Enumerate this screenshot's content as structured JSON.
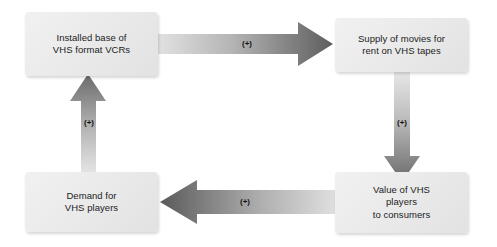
{
  "diagram": {
    "background_color": "#ffffff",
    "box_fill_color": "#ececec",
    "text_color": "#1c1c1c",
    "arrow_light_color": "#e3e3e3",
    "arrow_dark_color": "#5e5e5e",
    "nodes": [
      {
        "id": "installed-base",
        "label": "Installed base of\nVHS format VCRs"
      },
      {
        "id": "supply-of-movies",
        "label": "Supply of movies for\nrent on VHS tapes"
      },
      {
        "id": "value-of-players",
        "label": "Value of VHS\nplayers\nto consumers"
      },
      {
        "id": "demand-for-players",
        "label": "Demand for\nVHS players"
      }
    ],
    "edges": [
      {
        "id": "installed-base-to-supply",
        "from": "installed-base",
        "to": "supply-of-movies",
        "label": "(+)",
        "direction": "right"
      },
      {
        "id": "supply-to-value",
        "from": "supply-of-movies",
        "to": "value-of-players",
        "label": "(+)",
        "direction": "down"
      },
      {
        "id": "value-to-demand",
        "from": "value-of-players",
        "to": "demand-for-players",
        "label": "(+)",
        "direction": "left"
      },
      {
        "id": "demand-to-installed-base",
        "from": "demand-for-players",
        "to": "installed-base",
        "label": "(+)",
        "direction": "up"
      }
    ]
  }
}
